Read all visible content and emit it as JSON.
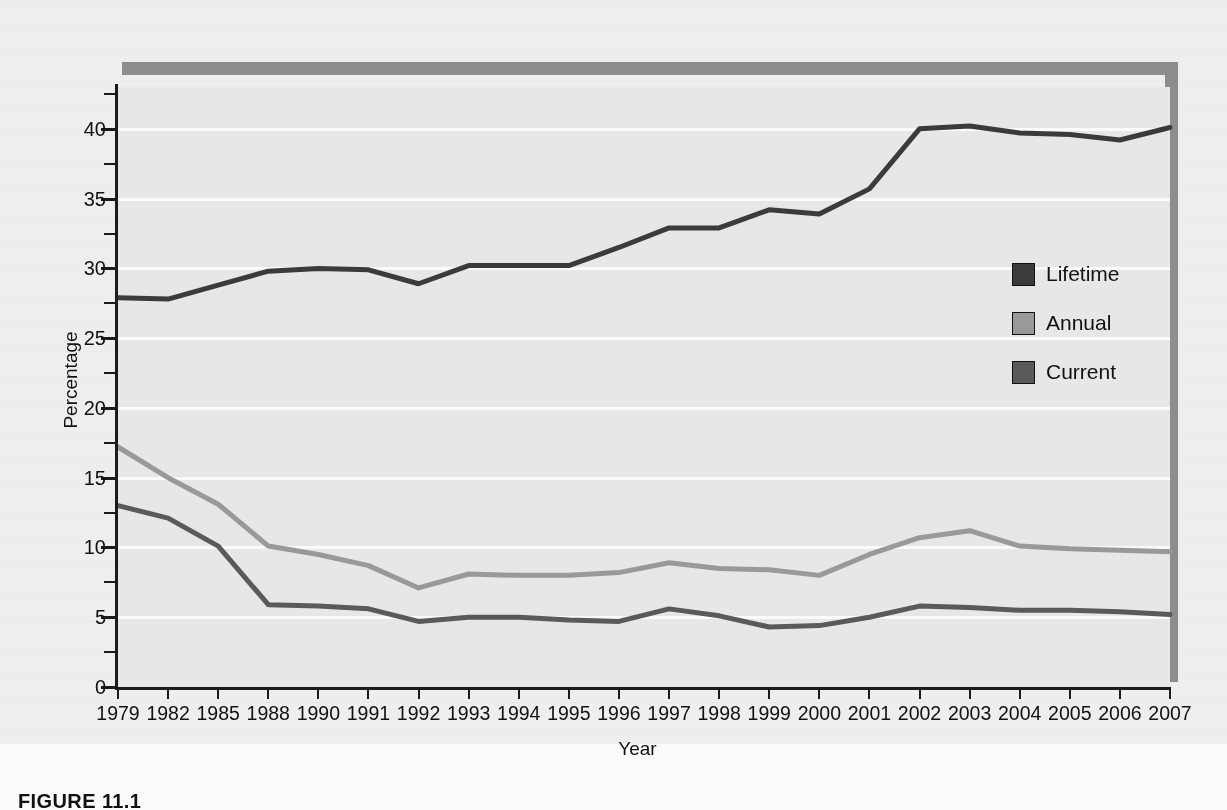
{
  "figure": {
    "caption": "FIGURE 11.1"
  },
  "chart_data": {
    "type": "line",
    "title": "",
    "xlabel": "Year",
    "ylabel": "Percentage",
    "ylim": [
      0,
      43
    ],
    "yticks": [
      0,
      5,
      10,
      15,
      20,
      25,
      30,
      35,
      40
    ],
    "ytick_labels": [
      "0",
      "5",
      "10",
      "15",
      "20",
      "25",
      "30",
      "35",
      "40"
    ],
    "minor_yticks": [
      2.5,
      7.5,
      12.5,
      17.5,
      22.5,
      27.5,
      32.5,
      37.5,
      42.5
    ],
    "grid": "horizontal",
    "legend_position": "right-inside",
    "categories": [
      "1979",
      "1982",
      "1985",
      "1988",
      "1990",
      "1991",
      "1992",
      "1993",
      "1994",
      "1995",
      "1996",
      "1997",
      "1998",
      "1999",
      "2000",
      "2001",
      "2002",
      "2003",
      "2004",
      "2005",
      "2006",
      "2007"
    ],
    "series": [
      {
        "name": "Lifetime",
        "color": "#3b3b3b",
        "values": [
          27.9,
          27.8,
          28.8,
          29.8,
          30.0,
          29.9,
          28.9,
          30.2,
          30.2,
          30.2,
          31.5,
          32.9,
          32.9,
          34.2,
          33.9,
          35.7,
          40.0,
          40.2,
          39.7,
          39.6,
          39.2,
          40.1
        ]
      },
      {
        "name": "Annual",
        "color": "#999999",
        "values": [
          17.2,
          15.0,
          13.1,
          10.1,
          9.5,
          8.7,
          7.1,
          8.1,
          8.0,
          8.0,
          8.2,
          8.9,
          8.5,
          8.4,
          8.0,
          9.5,
          10.7,
          11.2,
          10.1,
          9.9,
          9.8,
          9.7
        ]
      },
      {
        "name": "Current",
        "color": "#5a5a5a",
        "values": [
          13.0,
          12.1,
          10.1,
          5.9,
          5.8,
          5.6,
          4.7,
          5.0,
          5.0,
          4.8,
          4.7,
          5.6,
          5.1,
          4.3,
          4.4,
          5.0,
          5.8,
          5.7,
          5.5,
          5.5,
          5.4,
          5.2
        ]
      }
    ]
  },
  "legend": {
    "items": [
      {
        "label": "Lifetime",
        "color": "#3b3b3b"
      },
      {
        "label": "Annual",
        "color": "#999999"
      },
      {
        "label": "Current",
        "color": "#5a5a5a"
      }
    ]
  },
  "colors": {
    "rule": "#8d8d8d",
    "plot_background": "#e7e7e7",
    "gridline": "#fafafa",
    "axis": "#1b1b1b",
    "page_background": "#eeeeee"
  }
}
